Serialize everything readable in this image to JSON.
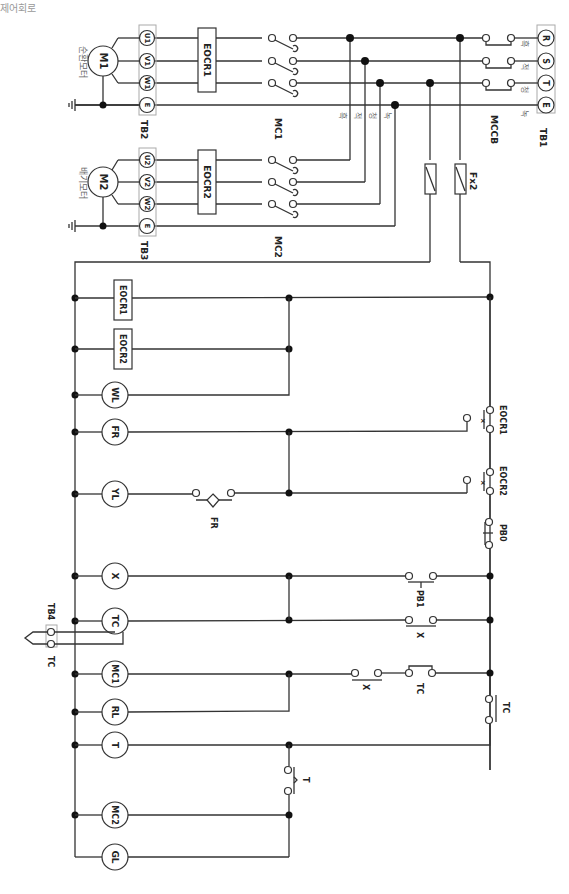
{
  "title": "제어회로",
  "power_circuit": {
    "tb1": {
      "label": "TB1",
      "terminals": [
        "R",
        "S",
        "T",
        "E"
      ],
      "wire_colors": [
        "흑",
        "적",
        "청",
        "녹"
      ]
    },
    "mccb": {
      "label": "MCCB"
    },
    "mc1": {
      "label": "MC1"
    },
    "mc2": {
      "label": "MC2"
    },
    "eocr1": {
      "label": "EOCR1"
    },
    "eocr2": {
      "label": "EOCR2"
    },
    "tb2": {
      "label": "TB2",
      "terminals": [
        "U1",
        "V1",
        "W1",
        "E"
      ]
    },
    "tb3": {
      "label": "TB3",
      "terminals": [
        "U2",
        "V2",
        "W2",
        "E"
      ]
    },
    "m1": {
      "label": "M1",
      "name": "순환모터"
    },
    "m2": {
      "label": "M2",
      "name": "배기모터"
    },
    "phase_labels": [
      "흑",
      "적",
      "청",
      "녹"
    ],
    "fuse": {
      "label": "Fx2"
    }
  },
  "control_circuit": {
    "loads": [
      "EOCR1",
      "EOCR2",
      "WL",
      "FR",
      "YL",
      "X",
      "TC",
      "MC1",
      "RL",
      "T",
      "MC2",
      "GL"
    ],
    "contacts": {
      "eocr1": "EOCR1",
      "eocr2": "EOCR2",
      "pb0": "PB0",
      "pb1": "PB1",
      "x1": "X",
      "x2": "X",
      "tc1": "TC",
      "tc2": "TC",
      "fr": "FR",
      "t": "T"
    },
    "tb4": {
      "label": "TB4",
      "sensor": "TC"
    }
  }
}
